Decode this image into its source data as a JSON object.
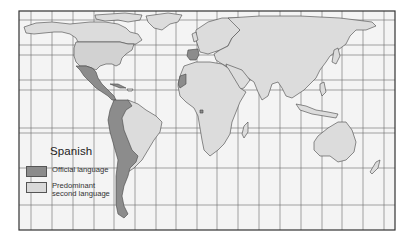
{
  "map": {
    "title": "Spanish",
    "colors": {
      "background": "#f4f4f4",
      "land": "#dcdcdc",
      "official": "#8c8c8c",
      "second": "#d6d6d6",
      "border": "#444444",
      "grid": "#555555",
      "frame": "#333333"
    }
  },
  "legend": {
    "title": "Spanish",
    "items": [
      {
        "label_line1": "Official language",
        "label_line2": "",
        "color": "#8c8c8c"
      },
      {
        "label_line1": "Predominant",
        "label_line2": "second language",
        "color": "#d9d9d9"
      }
    ]
  },
  "regions": {
    "official": [
      "Mexico",
      "Central America",
      "Cuba",
      "Dominican Republic",
      "Colombia",
      "Venezuela",
      "Ecuador",
      "Peru",
      "Bolivia",
      "Chile",
      "Argentina",
      "Paraguay",
      "Uruguay",
      "Spain",
      "Equatorial Guinea",
      "Western Sahara"
    ],
    "predominant_second": [
      "United States"
    ]
  }
}
